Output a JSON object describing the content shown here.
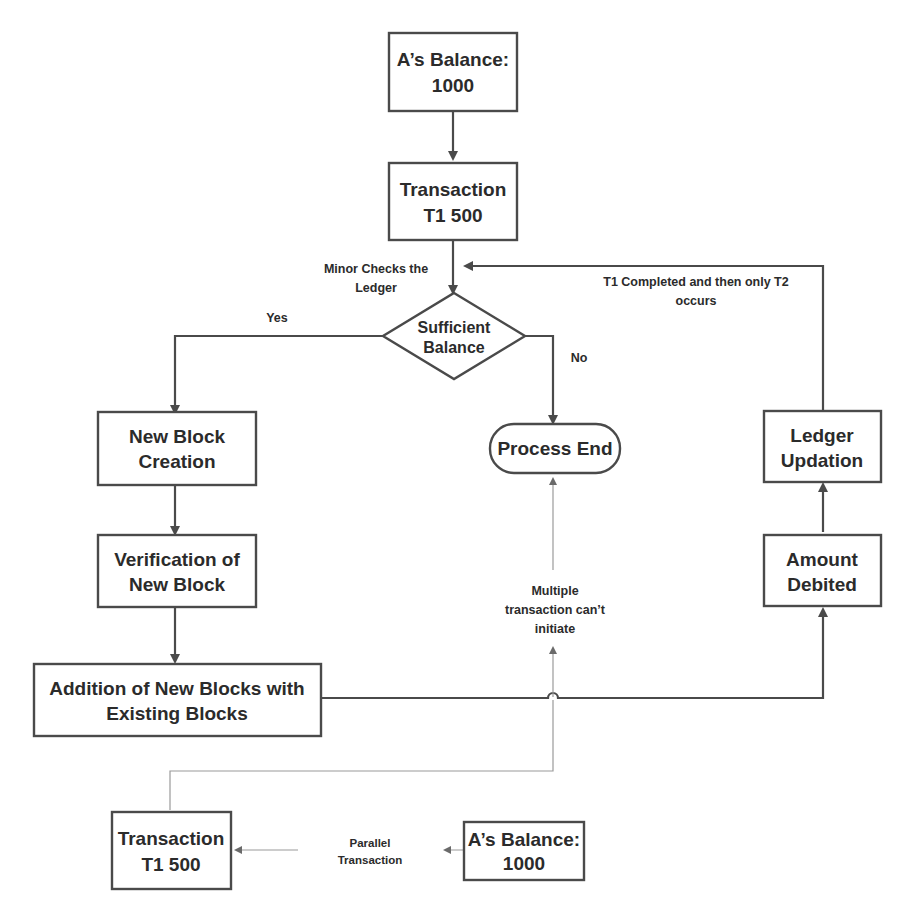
{
  "diagram": {
    "colors": {
      "stroke": "#4a4a4a",
      "thin_stroke": "#9a9a9a",
      "text": "#2b2b2b",
      "background": "#ffffff"
    },
    "nodes": {
      "balance_top": {
        "line1": "A’s Balance:",
        "line2": "1000",
        "shape": "rectangle"
      },
      "transaction_top": {
        "line1": "Transaction",
        "line2": "T1 500",
        "shape": "rectangle"
      },
      "decision": {
        "line1": "Sufficient",
        "line2": "Balance",
        "shape": "diamond"
      },
      "new_block": {
        "line1": "New Block",
        "line2": "Creation",
        "shape": "rectangle"
      },
      "verification": {
        "line1": "Verification of",
        "line2": "New Block",
        "shape": "rectangle"
      },
      "addition": {
        "line1": "Addition of New Blocks with",
        "line2": "Existing Blocks",
        "shape": "rectangle"
      },
      "process_end": {
        "line1": "Process End",
        "shape": "rounded"
      },
      "ledger_updation": {
        "line1": "Ledger",
        "line2": "Updation",
        "shape": "rectangle"
      },
      "amount_debited": {
        "line1": "Amount",
        "line2": "Debited",
        "shape": "rectangle"
      },
      "transaction_bottom": {
        "line1": "Transaction",
        "line2": "T1 500",
        "shape": "rectangle"
      },
      "balance_bottom": {
        "line1": "A’s Balance:",
        "line2": "1000",
        "shape": "rectangle"
      }
    },
    "edge_labels": {
      "minor_checks": {
        "line1": "Minor Checks the",
        "line2": "Ledger"
      },
      "yes": "Yes",
      "no": "No",
      "t1_completed": {
        "line1": "T1 Completed and then only T2",
        "line2": "occurs"
      },
      "multiple": {
        "line1": "Multiple",
        "line2": "transaction can’t",
        "line3": "initiate"
      },
      "parallel": {
        "line1": "Parallel",
        "line2": "Transaction"
      }
    }
  }
}
